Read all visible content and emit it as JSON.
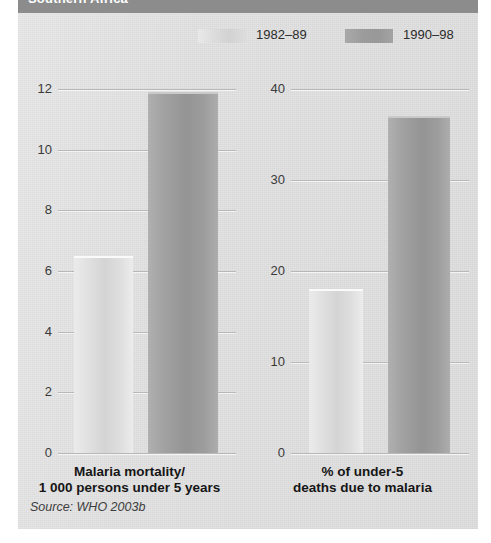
{
  "header": {
    "title": "Southern Africa"
  },
  "legend": {
    "entries": [
      {
        "label": "1982–89",
        "swatch": "light",
        "color": "#dcdcdc"
      },
      {
        "label": "1990–98",
        "swatch": "dark",
        "color": "#9b9b9b"
      }
    ]
  },
  "source": "Source: WHO 2003b",
  "chart_data": [
    {
      "type": "bar",
      "title": "Malaria mortality/\n1 000 persons under 5 years",
      "caption_line1": "Malaria mortality/",
      "caption_line2": "1 000 persons under 5 years",
      "categories": [
        "1982–89",
        "1990–98"
      ],
      "values": [
        6.5,
        11.9
      ],
      "xlabel": "",
      "ylabel": "",
      "ylim": [
        0,
        12.6
      ],
      "yticks": [
        0,
        2,
        4,
        6,
        8,
        10,
        12
      ],
      "ytick_labels": [
        "0",
        "2",
        "4",
        "6",
        "8",
        "10",
        "12"
      ],
      "grid": true,
      "legend_position": "top"
    },
    {
      "type": "bar",
      "title": "% of under-5\ndeaths due to malaria",
      "caption_line1": "% of under-5",
      "caption_line2": "deaths due to malaria",
      "categories": [
        "1982–89",
        "1990–98"
      ],
      "values": [
        18,
        37
      ],
      "xlabel": "",
      "ylabel": "",
      "ylim": [
        0,
        42
      ],
      "yticks": [
        0,
        10,
        20,
        30,
        40
      ],
      "ytick_labels": [
        "0",
        "10",
        "20",
        "30",
        "40"
      ],
      "grid": true,
      "legend_position": "top"
    }
  ],
  "colors": {
    "panel_background": "#e2e2e2",
    "header_bar": "#8c8c8c",
    "bar_light": "#dcdcdc",
    "bar_dark": "#9b9b9b",
    "gridline": "#b8b8b8",
    "text": "#161616"
  }
}
